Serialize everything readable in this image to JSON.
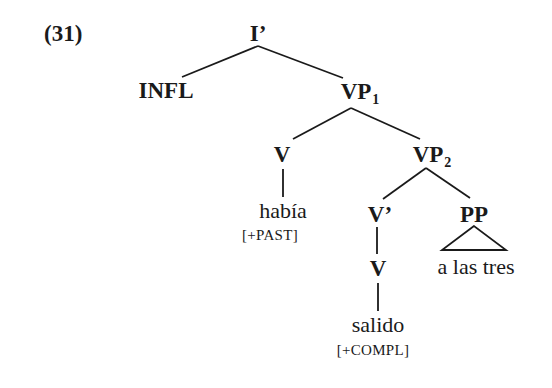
{
  "example_number": "(31)",
  "tree": {
    "root": {
      "label": "I’"
    },
    "infl": {
      "label": "INFL"
    },
    "vp1": {
      "label": "VP",
      "subscript": "1"
    },
    "v_aux": {
      "label": "V",
      "word": "había",
      "feature": "[+PAST]"
    },
    "vp2": {
      "label": "VP",
      "subscript": "2"
    },
    "v_bar": {
      "label": "V’"
    },
    "v_main": {
      "label": "V",
      "word": "salido",
      "feature": "[+COMPL]"
    },
    "pp": {
      "label": "PP",
      "phrase": "a las tres",
      "collapsed_triangle": true
    }
  },
  "edges": [
    [
      "I’",
      "INFL"
    ],
    [
      "I’",
      "VP1"
    ],
    [
      "VP1",
      "V"
    ],
    [
      "VP1",
      "VP2"
    ],
    [
      "V",
      "había"
    ],
    [
      "VP2",
      "V’"
    ],
    [
      "VP2",
      "PP"
    ],
    [
      "V’",
      "V"
    ],
    [
      "V",
      "salido"
    ],
    [
      "PP",
      "a las tres (triangle)"
    ]
  ]
}
